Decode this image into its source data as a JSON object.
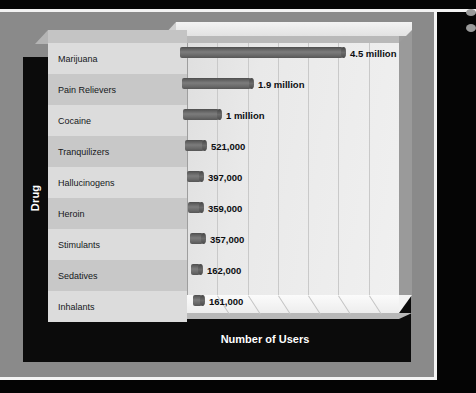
{
  "slide": {
    "frame_color": "#8a8a8a",
    "border_color": "#f4f4f4",
    "background_color": "#000000"
  },
  "chart_data": {
    "type": "bar",
    "orientation": "horizontal",
    "title": "",
    "xlabel": "Number of Users",
    "ylabel": "Drug",
    "grid": true,
    "legend_position": "none",
    "xlim": [
      0,
      5200000
    ],
    "categories": [
      "Marijuana",
      "Pain Relievers",
      "Cocaine",
      "Tranquilizers",
      "Hallucinogens",
      "Heroin",
      "Stimulants",
      "Sedatives",
      "Inhalants"
    ],
    "values": [
      4500000,
      1900000,
      1000000,
      521000,
      397000,
      359000,
      357000,
      162000,
      161000
    ],
    "data_labels": [
      "4.5 million",
      "1.9 million",
      "1 million",
      "521,000",
      "397,000",
      "359,000",
      "357,000",
      "162,000",
      "161,000"
    ],
    "bar_color": "#6f6f6f",
    "plot_wall_color": "#e9e9e9",
    "gridline_count": 6
  }
}
